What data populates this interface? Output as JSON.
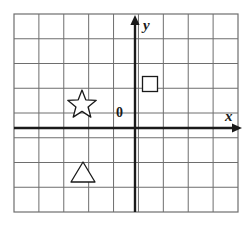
{
  "figure": {
    "kind": "coordinate-plane-diagram",
    "width": 252,
    "height": 226,
    "background_color": "#ffffff"
  },
  "grid": {
    "name": "square-grid",
    "left": 14,
    "top": 14,
    "right": 238,
    "bottom": 212,
    "columns": 9,
    "rows": 8,
    "cell_width": 24.9,
    "cell_height": 24.75,
    "line_color": "#6e6e6e",
    "border_color": "#6e6e6e",
    "line_width": 1
  },
  "axes": {
    "color": "#1a1a1a",
    "line_width": 2.4,
    "origin": {
      "x": 135,
      "y": 128
    },
    "x_axis": {
      "label": "x",
      "start_x": 14,
      "end_x": 242,
      "y": 128,
      "arrow": "right"
    },
    "y_axis": {
      "label": "y",
      "x": 135,
      "start_y": 212,
      "end_y": 16,
      "arrow": "up"
    },
    "origin_label": "0"
  },
  "shapes": [
    {
      "name": "star",
      "type": "star-5-point",
      "center_x": 82,
      "center_y": 105,
      "outer_radius": 15,
      "inner_radius": 6.4,
      "stroke": "#1a1a1a",
      "fill": "#ffffff",
      "quadrant": "II"
    },
    {
      "name": "square",
      "type": "square",
      "center_x": 150,
      "center_y": 84,
      "size": 15,
      "stroke": "#1a1a1a",
      "fill": "#ffffff",
      "quadrant": "I"
    },
    {
      "name": "triangle",
      "type": "triangle-up",
      "apex_x": 83,
      "apex_y": 162,
      "base_left_x": 71,
      "base_right_x": 95,
      "base_y": 182,
      "stroke": "#1a1a1a",
      "fill": "#ffffff",
      "quadrant": "III"
    }
  ]
}
